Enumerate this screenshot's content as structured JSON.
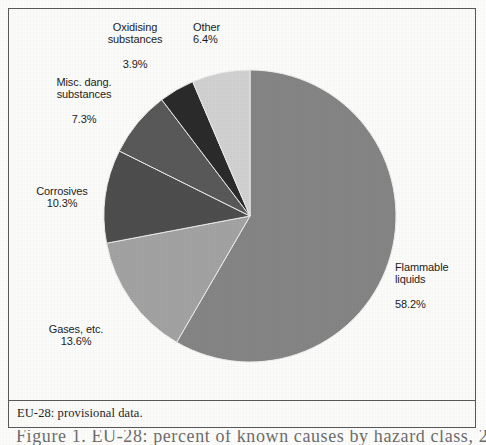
{
  "figure": {
    "footnote": "EU-28: provisional data.",
    "caption_partial": "Figure 1. EU-28: percent of known causes by hazard class, 201"
  },
  "chart_data": {
    "type": "pie",
    "title": "",
    "subtitle": "",
    "xlabel": "",
    "ylabel": "",
    "legend_position": "none",
    "grid": false,
    "units": "percent",
    "start_angle_deg": 0,
    "direction": "clockwise",
    "categories": [
      "Flammable liquids",
      "Gases, etc.",
      "Corrosives",
      "Misc. dang. substances",
      "Oxidising substances",
      "Other"
    ],
    "values": [
      58.2,
      13.6,
      10.3,
      7.3,
      3.9,
      6.4
    ],
    "slices": [
      {
        "label": "Flammable liquids",
        "label_line1": "Flammable",
        "label_line2": "liquids",
        "value": 58.2,
        "value_text": "58.2%",
        "color": "#858585"
      },
      {
        "label": "Gases, etc.",
        "label_line1": "Gases, etc.",
        "label_line2": "",
        "value": 13.6,
        "value_text": "13.6%",
        "color": "#a3a3a3"
      },
      {
        "label": "Corrosives",
        "label_line1": "Corrosives",
        "label_line2": "",
        "value": 10.3,
        "value_text": "10.3%",
        "color": "#4e4e4e"
      },
      {
        "label": "Misc. dang. substances",
        "label_line1": "Misc. dang.",
        "label_line2": "substances",
        "value": 7.3,
        "value_text": "7.3%",
        "color": "#595959"
      },
      {
        "label": "Oxidising substances",
        "label_line1": "Oxidising",
        "label_line2": "substances",
        "value": 3.9,
        "value_text": "3.9%",
        "color": "#2b2b2b"
      },
      {
        "label": "Other",
        "label_line1": "Other",
        "label_line2": "",
        "value": 6.4,
        "value_text": "6.4%",
        "color": "#d2d2d2"
      }
    ]
  }
}
